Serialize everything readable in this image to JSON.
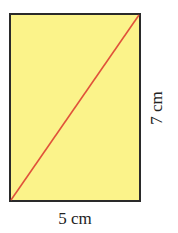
{
  "figure": {
    "shape": "rectangle",
    "fill_color": "#fbf38a",
    "border_color": "#2a2a2a",
    "diagonal_color": "#e0523a",
    "width_label": "5 cm",
    "height_label": "7 cm"
  }
}
